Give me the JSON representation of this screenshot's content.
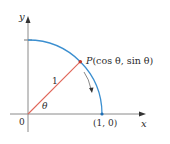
{
  "diagram": {
    "labels": {
      "y_axis": "y",
      "x_axis": "x",
      "origin": "0",
      "point_p": "P(cos θ, sin θ)",
      "point_p_letter": "P",
      "point_p_coords": "(cos θ, sin θ)",
      "radius": "1",
      "angle": "θ",
      "point_one_zero": "(1, 0)"
    },
    "colors": {
      "axis": "#8a8a8a",
      "arc": "#3b8fd0",
      "radius_line": "#e0675a",
      "point_p": "#c0392b",
      "point_one_zero": "#1f6fb5",
      "arrow": "#333333",
      "text": "#2b2b2b"
    },
    "geometry": {
      "origin": [
        28,
        114
      ],
      "radius_px": 74,
      "theta_deg": 45
    }
  }
}
